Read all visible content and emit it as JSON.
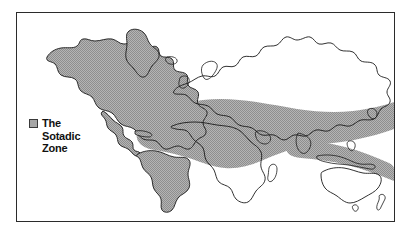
{
  "figure": {
    "background_color": "#ffffff",
    "frame_border_color": "#2b2b2b"
  },
  "legend": {
    "swatch_name": "sotadic-zone-swatch",
    "swatch_color": "#a6a6a6",
    "swatch_border_color": "#3a3a3a",
    "line_1": "The",
    "line_2": "Sotadic",
    "line_3": "Zone",
    "full_label": "The Sotadic Zone"
  },
  "map": {
    "projection_note": "world map, equirectangular-style outline",
    "land_outline_color": "#1a1a1a",
    "land_fill_americas": "#a6a6a6",
    "land_fill_old_world": "#ffffff",
    "zone_fill_color": "#a6a6a6",
    "zone_description": "shaded band spanning the Mediterranean, North Africa, the Middle East, South Asia and Southeast Asia",
    "regions": [
      {
        "name": "North America",
        "shaded": "true"
      },
      {
        "name": "South America",
        "shaded": "true"
      },
      {
        "name": "Greenland",
        "shaded": "true"
      },
      {
        "name": "Europe",
        "shaded": "false"
      },
      {
        "name": "Africa",
        "shaded": "false"
      },
      {
        "name": "Asia",
        "shaded": "false"
      },
      {
        "name": "Australia",
        "shaded": "false"
      },
      {
        "name": "New Zealand",
        "shaded": "false"
      }
    ]
  }
}
